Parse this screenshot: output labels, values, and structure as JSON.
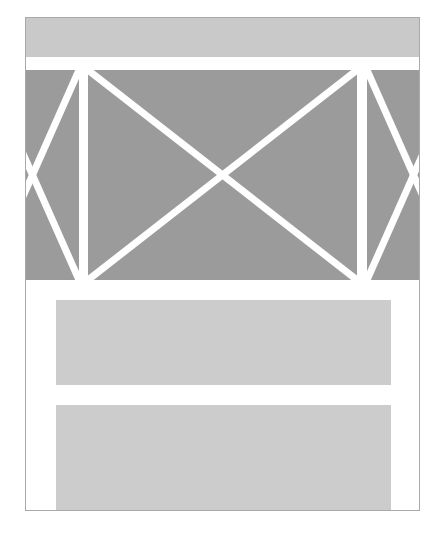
{
  "document": {
    "kind": "page-layout-wireframe",
    "canvas": {
      "width": 441,
      "height": 537,
      "background": "#ffffff"
    },
    "frame": {
      "name": "page-frame",
      "x": 25,
      "y": 17,
      "width": 395,
      "height": 494,
      "border_color": "#a9a9a9",
      "border_width": 1,
      "fill": "#ffffff"
    },
    "palette": {
      "page_background": "#ffffff",
      "frame_border": "#a9a9a9",
      "block_light_gray": "#c9c9c9",
      "block_mid_gray": "#cccccc",
      "media_dark_gray": "#9b9b9b",
      "divider_white": "#ffffff"
    },
    "blocks": [
      {
        "id": "header-band",
        "label": "header band",
        "type": "solid-block",
        "fill": "#c9c9c9",
        "x": 0,
        "y": 0,
        "width": 393,
        "height": 39
      },
      {
        "id": "media-left",
        "label": "left media placeholder",
        "type": "image-placeholder",
        "fill": "#9b9b9b",
        "cross": true,
        "clipped_edge": "left",
        "x": 0,
        "y": 52,
        "width": 53,
        "height": 210
      },
      {
        "id": "media-center",
        "label": "center media placeholder",
        "type": "image-placeholder",
        "fill": "#9b9b9b",
        "cross": true,
        "clipped_edge": "none",
        "x": 62,
        "y": 52,
        "width": 269,
        "height": 210
      },
      {
        "id": "media-right",
        "label": "right media placeholder",
        "type": "image-placeholder",
        "fill": "#9b9b9b",
        "cross": true,
        "clipped_edge": "right",
        "x": 341,
        "y": 52,
        "width": 52,
        "height": 210
      },
      {
        "id": "content-bar-1",
        "label": "first content block",
        "type": "solid-block",
        "fill": "#cccccc",
        "x": 30,
        "y": 282,
        "width": 335,
        "height": 85
      },
      {
        "id": "content-bar-2",
        "label": "second content block",
        "type": "solid-block",
        "fill": "#cccccc",
        "x": 30,
        "y": 387,
        "width": 335,
        "height": 105
      }
    ],
    "text": {
      "visible_strings": []
    }
  }
}
